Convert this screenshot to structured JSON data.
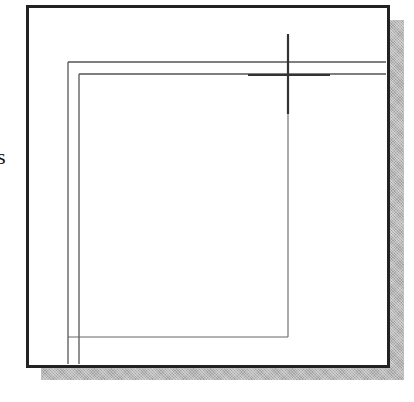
{
  "figure": {
    "edge_label": "s",
    "colors": {
      "frame": "#222222",
      "lines": "#555555",
      "crosshair": "#333333",
      "shadow": "#b8b8b8",
      "background": "#ffffff"
    },
    "elements": [
      "outer-frame",
      "drop-shadow",
      "inner-vertical-line-left-1",
      "inner-vertical-line-left-2",
      "inner-horizontal-line-top-1",
      "inner-horizontal-line-top-2",
      "inner-vertical-line-right",
      "inner-horizontal-line-bottom",
      "crosshair-cursor"
    ]
  }
}
